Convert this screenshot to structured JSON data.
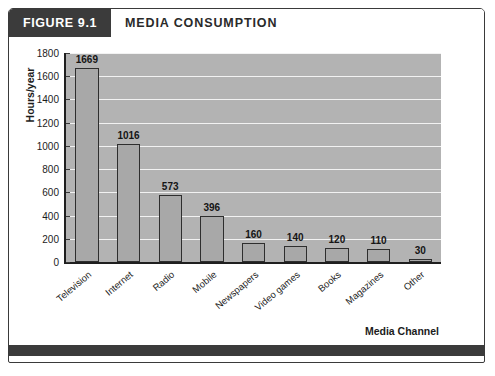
{
  "figure": {
    "number_label": "FIGURE 9.1",
    "title": "MEDIA CONSUMPTION"
  },
  "colors": {
    "header_block": "#3b3b3b",
    "plot_background": "#b3b3b3",
    "bar_fill": "#a8a8a8",
    "bar_border": "#2e2e2e",
    "gridline": "#f2f2f2",
    "axis": "#1f1f1f",
    "text": "#1c1c1c"
  },
  "chart_data": {
    "type": "bar",
    "title": "MEDIA CONSUMPTION",
    "xlabel": "Media Channel",
    "ylabel": "Hours/year",
    "ylim": [
      0,
      1800
    ],
    "ytick_step": 200,
    "yticks": [
      0,
      200,
      400,
      600,
      800,
      1000,
      1200,
      1400,
      1600,
      1800
    ],
    "ytick_labels": [
      "0",
      "200",
      "400",
      "600",
      "800",
      "1000",
      "1200",
      "1400",
      "1600",
      "1800"
    ],
    "grid": true,
    "grid_axis": "y",
    "legend": false,
    "categories": [
      "Television",
      "Internet",
      "Radio",
      "Mobile",
      "Newspapers",
      "Video games",
      "Books",
      "Magazines",
      "Other"
    ],
    "values": [
      1669,
      1016,
      573,
      396,
      160,
      140,
      120,
      110,
      30
    ],
    "value_labels": [
      "1669",
      "1016",
      "573",
      "396",
      "160",
      "140",
      "120",
      "110",
      "30"
    ],
    "data_labels_shown": true,
    "x_tick_label_rotation": -40
  }
}
